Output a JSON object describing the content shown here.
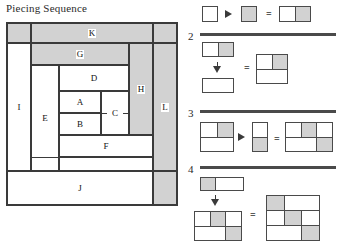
{
  "title": "Piecing Sequence",
  "colors": {
    "fabric_light": "#ffffff",
    "fabric_dark": "#d2d2d2",
    "line": "#3a3a3a",
    "background": "#ffffff"
  },
  "block_diagram": {
    "name": "piecing-block-diagram",
    "regions": [
      {
        "id": "K",
        "label": "K",
        "shade": "dark"
      },
      {
        "id": "G",
        "label": "G",
        "shade": "dark"
      },
      {
        "id": "I",
        "label": "I",
        "shade": "light"
      },
      {
        "id": "E",
        "label": "E",
        "shade": "light"
      },
      {
        "id": "D",
        "label": "D",
        "shade": "light"
      },
      {
        "id": "A",
        "label": "A",
        "shade": "light"
      },
      {
        "id": "B",
        "label": "B",
        "shade": "light"
      },
      {
        "id": "C",
        "label": "C",
        "shade": "light"
      },
      {
        "id": "F",
        "label": "F",
        "shade": "light"
      },
      {
        "id": "H",
        "label": "H",
        "shade": "dark"
      },
      {
        "id": "L",
        "label": "L",
        "shade": "dark"
      },
      {
        "id": "J",
        "label": "J",
        "shade": "light"
      },
      {
        "id": "corner_tl",
        "label": "",
        "shade": "dark"
      },
      {
        "id": "corner_tr",
        "label": "",
        "shade": "dark"
      },
      {
        "id": "corner_br",
        "label": "",
        "shade": "dark"
      }
    ]
  },
  "steps": [
    {
      "number": "1",
      "show_number": false,
      "operator_symbol": "▶",
      "equals_symbol": "=",
      "operands": [
        {
          "name": "unit-a",
          "rows": [
            {
              "cells": [
                "light"
              ]
            }
          ]
        },
        {
          "name": "unit-b",
          "rows": [
            {
              "cells": [
                "dark"
              ]
            }
          ]
        }
      ],
      "result": {
        "name": "result-1",
        "rows": [
          {
            "cells": [
              "light",
              "dark"
            ]
          }
        ]
      }
    },
    {
      "number": "2",
      "show_number": true,
      "operator_symbol": "▼",
      "equals_symbol": "=",
      "operands": [
        {
          "name": "unit-ab",
          "rows": [
            {
              "cells": [
                "light",
                "dark"
              ]
            }
          ]
        },
        {
          "name": "unit-c",
          "rows": [
            {
              "cells": [
                "light"
              ]
            }
          ]
        }
      ],
      "result": {
        "name": "result-2",
        "rows": [
          {
            "cells": [
              "light",
              "dark"
            ]
          },
          {
            "cells": [
              "light"
            ]
          }
        ]
      }
    },
    {
      "number": "3",
      "show_number": true,
      "operator_symbol": "▶",
      "equals_symbol": "=",
      "operands": [
        {
          "name": "unit-abc",
          "rows": [
            {
              "cells": [
                "light",
                "dark"
              ]
            },
            {
              "cells": [
                "light"
              ]
            }
          ]
        },
        {
          "name": "unit-d",
          "rows": [
            {
              "cells": [
                "light"
              ]
            },
            {
              "cells": [
                "dark"
              ]
            }
          ]
        }
      ],
      "result": {
        "name": "result-3",
        "rows": [
          {
            "cells": [
              "light",
              "dark",
              "light"
            ]
          },
          {
            "cells": [
              "light",
              "dark"
            ]
          }
        ]
      }
    },
    {
      "number": "4",
      "show_number": true,
      "operator_symbol": "▼",
      "equals_symbol": "=",
      "operands": [
        {
          "name": "unit-e",
          "rows": [
            {
              "cells": [
                "dark",
                "light"
              ]
            }
          ]
        },
        {
          "name": "unit-abcd",
          "rows": [
            {
              "cells": [
                "light",
                "dark",
                "light"
              ]
            },
            {
              "cells": [
                "light",
                "dark"
              ]
            }
          ]
        }
      ],
      "result": {
        "name": "result-4",
        "rows": [
          {
            "cells": [
              "dark",
              "light"
            ]
          },
          {
            "cells": [
              "light",
              "dark",
              "light"
            ]
          },
          {
            "cells": [
              "light",
              "dark"
            ]
          }
        ]
      }
    }
  ]
}
